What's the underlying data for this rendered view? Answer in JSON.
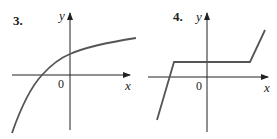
{
  "graphs": [
    {
      "number": "3.",
      "x_label": "x",
      "y_label": "y",
      "origin_label": "0",
      "description": "increasing concave-down curve approaching a horizontal asymptote; negative x-intercept, positive y-intercept",
      "curve_points": [
        [
          -4.2,
          -4.0
        ],
        [
          -2.5,
          0
        ],
        [
          0,
          1.6
        ],
        [
          2.5,
          2.7
        ],
        [
          4.5,
          3.0
        ]
      ]
    },
    {
      "number": "4.",
      "x_label": "x",
      "y_label": "y",
      "origin_label": "0",
      "description": "piecewise linear: steep rising segment, horizontal segment above x-axis, steep rising segment",
      "curve_points": [
        [
          -3.4,
          -3.0
        ],
        [
          -2.4,
          1.2
        ],
        [
          2.9,
          1.2
        ],
        [
          3.9,
          3.4
        ]
      ]
    }
  ],
  "colors": {
    "curve": "#555555",
    "axis": "#222222"
  }
}
